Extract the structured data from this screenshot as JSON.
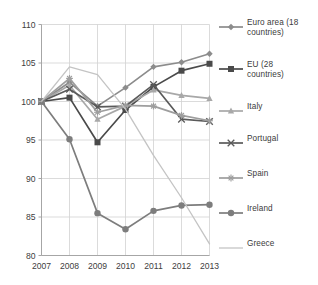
{
  "chart_data": {
    "type": "line",
    "title": "",
    "subtitle": "",
    "xlabel": "",
    "ylabel": "",
    "categories": [
      "2007",
      "2008",
      "2009",
      "2010",
      "2011",
      "2012",
      "2013"
    ],
    "x": [
      2007,
      2008,
      2009,
      2010,
      2011,
      2012,
      2013
    ],
    "xlim": [
      2007,
      2013
    ],
    "ylim": [
      80,
      110
    ],
    "yticks": [
      80,
      85,
      90,
      95,
      100,
      105,
      110
    ],
    "ytick_labels": [
      "80",
      "85",
      "90",
      "95",
      "100",
      "105",
      "110"
    ],
    "grid": true,
    "legend_position": "right",
    "series": [
      {
        "name": "Euro area (18 countries)",
        "legend_label": "Euro area (18\ncountries)",
        "marker": "diamond",
        "color": "#8c8c8c",
        "values": [
          100.0,
          102.5,
          99.4,
          101.8,
          104.5,
          105.1,
          106.2
        ]
      },
      {
        "name": "EU (28 countries)",
        "legend_label": "EU (28\ncountries)",
        "marker": "square",
        "color": "#4a4a4a",
        "values": [
          100.0,
          100.5,
          94.7,
          98.9,
          101.9,
          104.0,
          104.9
        ]
      },
      {
        "name": "Italy",
        "legend_label": "Italy",
        "marker": "triangle",
        "color": "#a8a8a8",
        "values": [
          100.0,
          102.1,
          97.7,
          99.4,
          101.5,
          100.8,
          100.4
        ]
      },
      {
        "name": "Portugal",
        "legend_label": "Portugal",
        "marker": "x",
        "color": "#5a5a5a",
        "values": [
          100.0,
          101.6,
          99.3,
          99.4,
          102.2,
          97.7,
          97.4
        ]
      },
      {
        "name": "Spain",
        "legend_label": "Spain",
        "marker": "star",
        "color": "#9e9e9e",
        "values": [
          100.0,
          103.0,
          98.6,
          99.5,
          99.4,
          98.2,
          97.5
        ]
      },
      {
        "name": "Ireland",
        "legend_label": "Ireland",
        "marker": "circle",
        "color": "#7d7d7d",
        "values": [
          100.0,
          95.1,
          85.5,
          83.4,
          85.8,
          86.5,
          86.6
        ]
      },
      {
        "name": "Greece",
        "legend_label": "Greece",
        "marker": "none",
        "color": "#c4c4c4",
        "values": [
          100.0,
          104.5,
          103.5,
          99.0,
          93.0,
          87.5,
          81.5
        ]
      }
    ]
  }
}
